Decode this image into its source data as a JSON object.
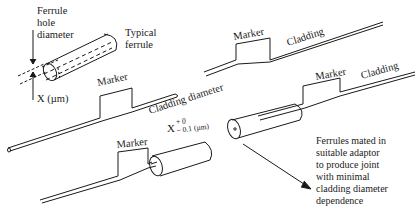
{
  "diagram": {
    "labels": {
      "ferrule_hole_line1": "Ferrule",
      "ferrule_hole_line2": "hole",
      "ferrule_hole_line3": "diameter",
      "typical_line1": "Typical",
      "typical_line2": "ferrule",
      "x_um": "X (µm)",
      "marker_top_right": "Marker",
      "cladding_top_right": "Cladding",
      "marker_middle_left": "Marker",
      "cladding_diameter": "Cladding diameter",
      "tolerance_x": "X",
      "tolerance_plus": "+ 0",
      "tolerance_minus": "− 0.1 (µm)",
      "marker_middle_right": "Marker",
      "cladding_middle_right": "Cladding",
      "marker_bottom": "Marker",
      "note_line1": "Ferrules mated in",
      "note_line2": "suitable adaptor",
      "note_line3": "to produce joint",
      "note_line4": "with minimal",
      "note_line5": "cladding diameter",
      "note_line6": "dependence"
    },
    "colors": {
      "stroke": "#1a1a1a",
      "background": "#ffffff"
    }
  }
}
